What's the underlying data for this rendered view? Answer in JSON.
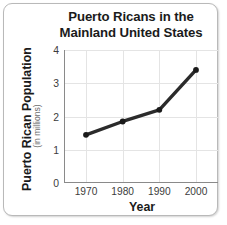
{
  "figure": {
    "title_line1": "Puerto Ricans in the",
    "title_line2": "Mainland United States",
    "frame_color": "#b9b9b9",
    "background_color": "#ffffff"
  },
  "axes": {
    "ylabel_main": "Puerto Rican Population",
    "ylabel_sub": "(in millions)",
    "xlabel": "Year"
  },
  "chart_data": {
    "type": "line",
    "title": "Puerto Ricans in the Mainland United States",
    "xlabel": "Year",
    "ylabel": "Puerto Rican Population (in millions)",
    "x": [
      1970,
      1980,
      1990,
      2000
    ],
    "categories": [
      "1970",
      "1980",
      "1990",
      "2000"
    ],
    "values": [
      1.45,
      1.85,
      2.2,
      3.4
    ],
    "xtick_labels": [
      "1970",
      "1980",
      "1990",
      "2000"
    ],
    "ytick_labels": [
      "0",
      "1",
      "2",
      "3",
      "4"
    ],
    "ytick_values": [
      0,
      1,
      2,
      3,
      4
    ],
    "xlim": [
      1964,
      2006
    ],
    "ylim": [
      0,
      4
    ],
    "grid": true,
    "legend": false,
    "line_color": "#2b2b2b",
    "marker_color": "#1a1a1a",
    "grid_color": "#e4e4e4"
  }
}
